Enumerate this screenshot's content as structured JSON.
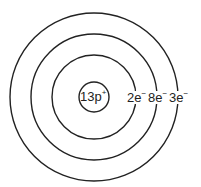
{
  "diagram": {
    "type": "bohr-model",
    "nucleus": {
      "label": "13p",
      "charge": "+"
    },
    "shells": [
      {
        "count": "2e",
        "charge": "−"
      },
      {
        "count": "8e",
        "charge": "−"
      },
      {
        "count": "3e",
        "charge": "−"
      }
    ],
    "colors": {
      "stroke": "#222222",
      "background": "#ffffff"
    }
  }
}
